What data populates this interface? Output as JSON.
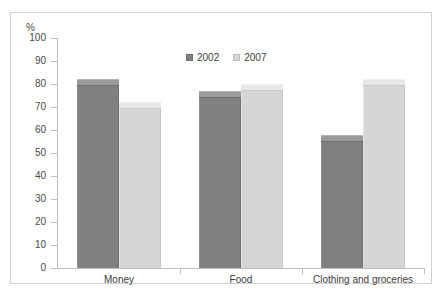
{
  "chart_data": {
    "type": "bar",
    "title": "",
    "subtitle": "",
    "xlabel": "",
    "ylabel": "%",
    "ylim": [
      0,
      100
    ],
    "ytick_step": 10,
    "yticks": [
      100,
      90,
      80,
      70,
      60,
      50,
      40,
      30,
      20,
      10,
      0
    ],
    "grid": false,
    "legend_position": "top-center",
    "categories": [
      "Money",
      "Food",
      "Clothing and groceries"
    ],
    "series": [
      {
        "name": "2002",
        "color": "#808080",
        "values": [
          82,
          77,
          58
        ]
      },
      {
        "name": "2007",
        "color": "#d6d6d6",
        "values": [
          72,
          80,
          82
        ]
      }
    ]
  },
  "legend": {
    "items": [
      {
        "label": "2002",
        "swatch": "legend-swatch-2002"
      },
      {
        "label": "2007",
        "swatch": "legend-swatch-2007"
      }
    ]
  },
  "axis": {
    "unit_label": "%"
  }
}
